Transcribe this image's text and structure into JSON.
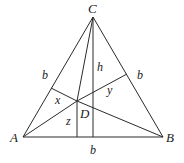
{
  "diagram": {
    "type": "geometry",
    "vertices": {
      "A": {
        "label": "A",
        "x": 23,
        "y": 137
      },
      "B": {
        "label": "B",
        "x": 163,
        "y": 137
      },
      "C": {
        "label": "C",
        "x": 93,
        "y": 17
      }
    },
    "point_D": {
      "label": "D",
      "x": 77,
      "y": 101
    },
    "side_labels": {
      "left": "b",
      "right": "b",
      "bottom": "b"
    },
    "segment_labels": {
      "altitude": "h",
      "perp_left": "x",
      "perp_right": "y",
      "perp_bottom": "z"
    },
    "stroke_color": "#2a2a2a",
    "background": "#ffffff"
  }
}
